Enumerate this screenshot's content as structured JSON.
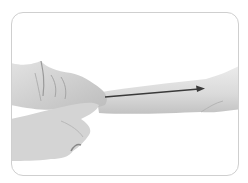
{
  "illustration": {
    "description": "Grayscale photo: two hands gripping a wrist with an arrow along the forearm pointing toward the elbow",
    "arrow_direction": "right",
    "colors": {
      "frame_border": "#cfcfcf",
      "skin_light": "#e6e6e6",
      "skin_mid": "#cfcfcf",
      "skin_dark": "#a9a9a9",
      "arrow": "#3a3a3a"
    }
  }
}
